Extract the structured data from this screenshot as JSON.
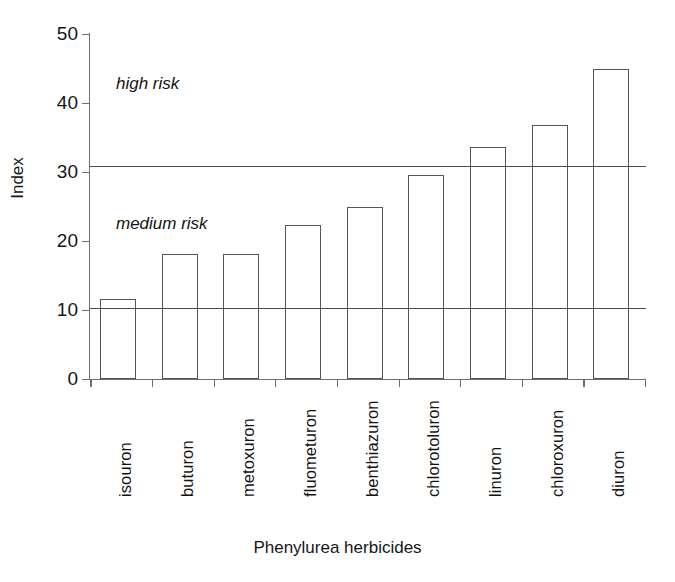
{
  "chart_data": {
    "type": "bar",
    "title": "",
    "xlabel": "Phenylurea herbicides",
    "ylabel": "Index",
    "ylim": [
      0,
      50
    ],
    "yticks": [
      0,
      10,
      20,
      30,
      40,
      50
    ],
    "grid": false,
    "legend": "none",
    "orientation": "vertical",
    "bar_style": "outline-only",
    "categories": [
      "isouron",
      "buturon",
      "metoxuron",
      "fluometuron",
      "benthiazuron",
      "chlorotoluron",
      "linuron",
      "chloroxuron",
      "diuron"
    ],
    "values": [
      11.6,
      18.1,
      18.1,
      22.3,
      24.9,
      29.5,
      33.6,
      36.8,
      44.8
    ],
    "threshold_lines": [
      {
        "label": "medium-risk-boundary",
        "value": 10.3
      },
      {
        "label": "high-risk-boundary",
        "value": 30.8
      }
    ],
    "annotations": [
      {
        "text": "high risk",
        "value_y": 43.0,
        "style": "italic"
      },
      {
        "text": "medium risk",
        "value_y": 22.5,
        "style": "italic"
      }
    ]
  },
  "axis": {
    "y_tick_labels": [
      "50",
      "40",
      "30",
      "20",
      "10",
      "0"
    ],
    "y_title": "Index",
    "x_title": "Phenylurea herbicides"
  },
  "annotations": {
    "high_risk": "high risk",
    "medium_risk": "medium risk"
  },
  "colors": {
    "axis": "#6e6e6e",
    "bar_outline": "#555555",
    "threshold": "#4a4a4a",
    "text": "#161616",
    "background": "#ffffff"
  }
}
